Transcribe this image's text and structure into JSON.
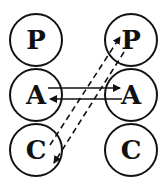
{
  "diagram": {
    "type": "transactional-analysis",
    "left": {
      "parent": "P",
      "adult": "A",
      "child": "C"
    },
    "right": {
      "parent": "P",
      "adult": "A",
      "child": "C"
    },
    "transactions": [
      {
        "from": "left.adult",
        "to": "right.adult",
        "style": "solid"
      },
      {
        "from": "right.adult",
        "to": "left.adult",
        "style": "solid"
      },
      {
        "from": "left.child",
        "to": "right.parent",
        "style": "dashed"
      },
      {
        "from": "right.parent",
        "to": "left.child",
        "style": "dashed"
      }
    ]
  }
}
